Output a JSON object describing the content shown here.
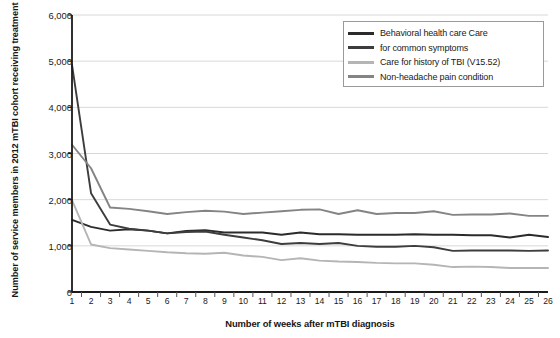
{
  "chart_data": {
    "type": "line",
    "title": "",
    "xlabel": "Number of weeks after mTBI diagnosis",
    "ylabel": "Number of service members in 2012 mTBI cohort receiving treatment",
    "xlim": [
      1,
      26
    ],
    "ylim": [
      0,
      6000
    ],
    "grid": true,
    "legend_position": "top-right",
    "x": [
      1,
      2,
      3,
      4,
      5,
      6,
      7,
      8,
      9,
      10,
      11,
      12,
      13,
      14,
      15,
      16,
      17,
      18,
      19,
      20,
      21,
      22,
      23,
      24,
      25,
      26
    ],
    "categories": [
      "1",
      "2",
      "3",
      "4",
      "5",
      "6",
      "7",
      "8",
      "9",
      "10",
      "11",
      "12",
      "13",
      "14",
      "15",
      "16",
      "17",
      "18",
      "19",
      "20",
      "21",
      "22",
      "23",
      "24",
      "25",
      "26"
    ],
    "ytick_labels": [
      "0",
      "1,000",
      "2,000",
      "3,000",
      "4,000",
      "5,000",
      "6,000"
    ],
    "ytick_values": [
      0,
      1000,
      2000,
      3000,
      4000,
      5000,
      6000
    ],
    "series": [
      {
        "name": "Behavioral health care",
        "color": "#2b2b2b",
        "values": [
          1560,
          1410,
          1330,
          1360,
          1330,
          1270,
          1320,
          1340,
          1290,
          1290,
          1290,
          1240,
          1290,
          1250,
          1250,
          1240,
          1240,
          1240,
          1250,
          1240,
          1240,
          1230,
          1230,
          1180,
          1240,
          1190
        ]
      },
      {
        "name": "Care for common symptoms",
        "color": "#3d3d3d",
        "values": [
          4920,
          2140,
          1460,
          1370,
          1330,
          1270,
          1300,
          1310,
          1240,
          1180,
          1120,
          1040,
          1060,
          1040,
          1060,
          1000,
          980,
          980,
          1000,
          970,
          890,
          900,
          900,
          900,
          890,
          900
        ]
      },
      {
        "name": "Care for history of TBI (V15.52)",
        "color": "#b5b5b5",
        "values": [
          1990,
          1030,
          950,
          920,
          890,
          860,
          840,
          830,
          850,
          790,
          760,
          690,
          730,
          680,
          660,
          650,
          630,
          620,
          620,
          590,
          540,
          550,
          540,
          520,
          520,
          520
        ]
      },
      {
        "name": "Non-headache pain condition",
        "color": "#848484",
        "values": [
          3190,
          2680,
          1830,
          1800,
          1750,
          1690,
          1730,
          1760,
          1740,
          1690,
          1720,
          1750,
          1780,
          1790,
          1690,
          1770,
          1690,
          1710,
          1710,
          1750,
          1670,
          1680,
          1680,
          1700,
          1650,
          1650
        ]
      }
    ]
  },
  "legend": {
    "items": [
      {
        "label": "Behavioral health care Care",
        "color": "#2b2b2b"
      },
      {
        "label": "for common symptoms",
        "color": "#3d3d3d"
      },
      {
        "label": "Care for history of TBI (V15.52)",
        "color": "#b5b5b5"
      },
      {
        "label": "Non-headache pain condition",
        "color": "#848484"
      }
    ]
  },
  "axes": {
    "y_title": "Number of service members in 2012 mTBI cohort receiving treatment",
    "x_title": "Number of weeks after mTBI diagnosis"
  },
  "colors": {
    "axis": "#1a1a1a",
    "grid": "#d8d8d8",
    "background": "#ffffff"
  }
}
